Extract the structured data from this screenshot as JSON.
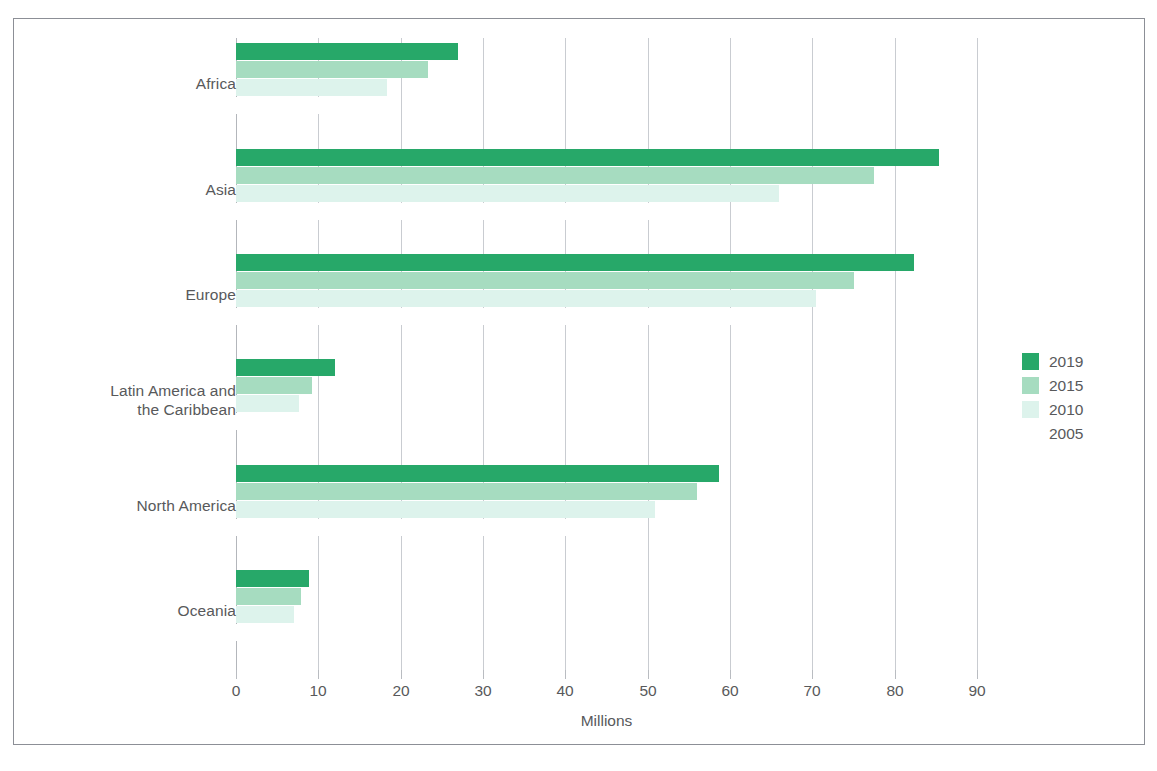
{
  "axis_title": "Millions",
  "legend": {
    "entries": [
      {
        "label": "2019",
        "color": "#27a869"
      },
      {
        "label": "2015",
        "color": "#a6dcc0"
      },
      {
        "label": "2010",
        "color": "#ddf3ec"
      },
      {
        "label": "2005",
        "color": "#ffffff"
      }
    ]
  },
  "chart_data": {
    "type": "bar",
    "orientation": "horizontal",
    "title": "",
    "xlabel": "Millions",
    "ylabel": "",
    "xlim": [
      0,
      90
    ],
    "xticks": [
      0,
      10,
      20,
      30,
      40,
      50,
      60,
      70,
      80,
      90
    ],
    "xtick_labels": [
      "0",
      "10",
      "20",
      "30",
      "40",
      "50",
      "60",
      "70",
      "80",
      "90"
    ],
    "grid": true,
    "grid_axis": "x",
    "legend_position": "right",
    "categories": [
      "Africa",
      "Asia",
      "Europe",
      "Latin America and the Caribbean",
      "North America",
      "Oceania"
    ],
    "category_labels": [
      [
        "Africa"
      ],
      [
        "Asia"
      ],
      [
        "Europe"
      ],
      [
        "Latin America and",
        "the Caribbean"
      ],
      [
        "North America"
      ],
      [
        "Oceania"
      ]
    ],
    "series": [
      {
        "name": "2019",
        "color": "#27a869",
        "values": [
          27.0,
          85.4,
          82.3,
          12.0,
          58.7,
          8.9
        ]
      },
      {
        "name": "2015",
        "color": "#a6dcc0",
        "values": [
          23.3,
          77.5,
          75.0,
          9.2,
          56.0,
          7.9
        ]
      },
      {
        "name": "2010",
        "color": "#ddf3ec",
        "values": [
          18.3,
          66.0,
          70.5,
          7.7,
          50.9,
          7.0
        ]
      },
      {
        "name": "2005",
        "color": "#ffffff",
        "values": [
          15.6,
          57.0,
          64.1,
          6.9,
          45.4,
          6.1
        ]
      }
    ]
  }
}
